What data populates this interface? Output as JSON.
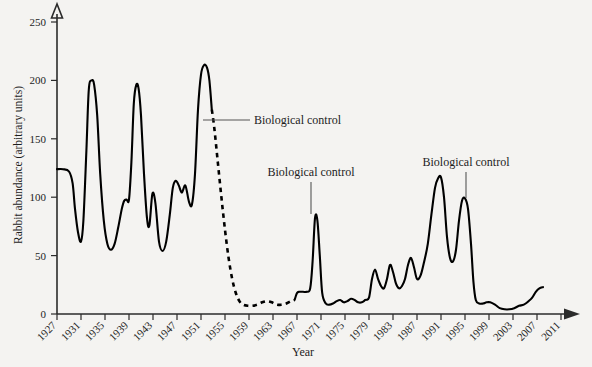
{
  "chart_data": {
    "type": "line",
    "title": "",
    "xlabel": "Year",
    "ylabel": "Rabbit abundance (arbitrary units)",
    "xlim": [
      1927,
      2011
    ],
    "ylim": [
      0,
      250
    ],
    "grid": false,
    "legend": "none",
    "xticks": [
      1927,
      1931,
      1935,
      1939,
      1943,
      1947,
      1951,
      1955,
      1959,
      1963,
      1967,
      1971,
      1975,
      1979,
      1983,
      1987,
      1991,
      1995,
      1999,
      2003,
      2007,
      2011
    ],
    "yticks": [
      0,
      50,
      100,
      150,
      200,
      250
    ],
    "series": [
      {
        "name": "Rabbit abundance (solid, observed)",
        "style": "solid",
        "x": [
          1927,
          1928,
          1929,
          1929.6,
          1930,
          1930.5,
          1931,
          1931.4,
          1931.9,
          1932.3,
          1932.8,
          1933.2,
          1933.7,
          1934.2,
          1934.8,
          1935.4,
          1936,
          1936.6,
          1937.2,
          1937.8,
          1938.2,
          1938.6,
          1939,
          1939.4,
          1939.8,
          1940.2,
          1940.6,
          1941,
          1941.5,
          1942,
          1942.4,
          1942.9,
          1943.4,
          1944,
          1944.6,
          1945.2,
          1945.8,
          1946.3,
          1946.8,
          1947.3,
          1947.8,
          1948.4,
          1949,
          1949.5,
          1950,
          1950.5,
          1951,
          1951.5,
          1952,
          1952.4,
          1952.8
        ],
        "y": [
          124,
          124,
          122,
          112,
          90,
          70,
          62,
          80,
          140,
          192,
          200,
          196,
          170,
          120,
          80,
          60,
          55,
          60,
          74,
          90,
          97,
          98,
          98,
          130,
          180,
          196,
          193,
          170,
          120,
          82,
          76,
          103,
          95,
          62,
          54,
          62,
          85,
          108,
          114,
          110,
          104,
          110,
          96,
          94,
          120,
          175,
          205,
          213,
          211,
          200,
          175
        ]
      },
      {
        "name": "Rabbit abundance (dashed, myxomatosis crash)",
        "style": "dashed",
        "x": [
          1952.8,
          1953.2,
          1953.8,
          1954.4,
          1955,
          1955.6,
          1956.2,
          1956.8,
          1957.4,
          1958,
          1958.8,
          1959.6,
          1960.4,
          1961.2,
          1962,
          1962.8,
          1963.6,
          1964.4,
          1965.2,
          1966,
          1966.6
        ],
        "y": [
          175,
          160,
          130,
          100,
          72,
          48,
          30,
          18,
          11,
          8,
          7,
          7,
          8,
          10,
          11,
          10,
          8,
          8,
          9,
          11,
          12
        ]
      },
      {
        "name": "Rabbit abundance (solid, post-1967)",
        "style": "solid",
        "x": [
          1966.6,
          1967,
          1967.4,
          1968,
          1968.6,
          1969.2,
          1969.6,
          1970,
          1970.4,
          1970.8,
          1971.2,
          1971.8,
          1972.4,
          1973,
          1973.6,
          1974.2,
          1974.8,
          1975.4,
          1976,
          1976.6,
          1977.2,
          1977.8,
          1978.4,
          1979,
          1979.5,
          1980,
          1980.5,
          1981,
          1981.5,
          1982,
          1982.5,
          1983,
          1983.5,
          1984,
          1984.5,
          1985,
          1985.5,
          1986,
          1986.5,
          1987,
          1987.6,
          1988.2,
          1988.8,
          1989.4,
          1990,
          1990.5,
          1991,
          1991.5,
          1992,
          1992.5,
          1993,
          1993.5,
          1994,
          1994.5,
          1995,
          1995.5,
          1996,
          1996.4,
          1996.8,
          1997.4,
          1998,
          1998.6,
          1999.2,
          2000,
          2000.8,
          2001.6,
          2002.4,
          2003.2,
          2004,
          2004.8,
          2005.6,
          2006.2,
          2006.8,
          2007.4,
          2008
        ],
        "y": [
          12,
          18,
          19,
          19,
          19,
          22,
          45,
          82,
          80,
          50,
          18,
          9,
          8,
          9,
          11,
          12,
          10,
          11,
          13,
          12,
          10,
          10,
          12,
          14,
          30,
          38,
          30,
          24,
          22,
          30,
          42,
          36,
          26,
          22,
          24,
          30,
          42,
          48,
          40,
          30,
          33,
          45,
          60,
          85,
          108,
          116,
          117,
          100,
          66,
          48,
          45,
          55,
          80,
          97,
          99,
          90,
          60,
          28,
          12,
          9,
          9,
          10,
          10,
          8,
          5,
          4,
          4,
          5,
          7,
          8,
          11,
          14,
          19,
          22,
          23
        ]
      }
    ],
    "annotations": [
      {
        "label": "Biological control",
        "leader": "horizontal",
        "at_year": 1953,
        "at_value": 175
      },
      {
        "label": "Biological control",
        "leader": "vertical",
        "at_year": 1970,
        "at_value": 82
      },
      {
        "label": "Biological control",
        "leader": "vertical",
        "at_year": 1995,
        "at_value": 99
      }
    ]
  },
  "axes": {
    "y_title": "Rabbit abundance (arbitrary units)",
    "x_title": "Year",
    "y_tick_labels": [
      "0",
      "50",
      "100",
      "150",
      "200",
      "250"
    ],
    "x_tick_labels": [
      "1927",
      "1931",
      "1935",
      "1939",
      "1943",
      "1947",
      "1951",
      "1955",
      "1959",
      "1963",
      "1967",
      "1971",
      "1975",
      "1979",
      "1983",
      "1987",
      "1991",
      "1995",
      "1999",
      "2003",
      "2007",
      "2011"
    ]
  },
  "annotation_labels": {
    "first": "Biological control",
    "second": "Biological control",
    "third": "Biological control"
  },
  "colors": {
    "background": "#f4f3f1",
    "line": "#000000",
    "axis": "#2b2b2b",
    "leader": "#555555",
    "text": "#1d1d1d"
  }
}
